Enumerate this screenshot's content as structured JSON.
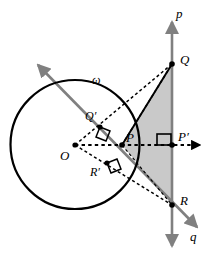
{
  "figure": {
    "type": "geometry-diagram",
    "background": "#ffffff",
    "colors": {
      "stroke_black": "#000000",
      "stroke_gray": "#808080",
      "triangle_fill": "#c9c9c9",
      "point_fill": "#000000"
    },
    "canvas": {
      "width": 213,
      "height": 260
    }
  },
  "labels": {
    "line_p": "p",
    "line_q": "q",
    "circle": "ω",
    "center": "O",
    "point_P": "P",
    "point_P_prime": "P′",
    "point_Q": "Q",
    "point_Q_prime": "Q′",
    "point_R": "R",
    "point_R_prime": "R′"
  },
  "geometry": {
    "circle": {
      "cx": 75,
      "cy": 144.5,
      "r": 64.5
    },
    "points": {
      "O": {
        "x": 75,
        "y": 145
      },
      "P": {
        "x": 122,
        "y": 145
      },
      "Pp": {
        "x": 172,
        "y": 145
      },
      "Q": {
        "x": 172,
        "y": 64
      },
      "Qp": {
        "x": 100,
        "y": 127
      },
      "R": {
        "x": 172,
        "y": 205
      },
      "Rp": {
        "x": 107,
        "y": 163
      }
    },
    "line_p": {
      "x": 172,
      "y_top": 20,
      "y_bottom": 248
    },
    "line_q": {
      "x1": 36,
      "y1": 63,
      "x2": 199,
      "y2": 229
    },
    "horizontal_ray": {
      "x1": 75,
      "y": 145,
      "x2": 206
    },
    "triangle": "P-Q-R shaded gray"
  },
  "label_positions": {
    "p": {
      "x": 176,
      "y": 14
    },
    "q": {
      "x": 191,
      "y": 236
    },
    "omega": {
      "x": 92,
      "y": 76
    },
    "O": {
      "x": 60,
      "y": 150
    },
    "P": {
      "x": 126,
      "y": 132
    },
    "Pprime": {
      "x": 178,
      "y": 131
    },
    "Q": {
      "x": 180,
      "y": 54
    },
    "Qprime": {
      "x": 86,
      "y": 112
    },
    "R": {
      "x": 180,
      "y": 196
    },
    "Rprime": {
      "x": 90,
      "y": 166
    }
  }
}
